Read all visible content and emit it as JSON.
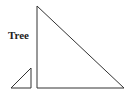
{
  "diagram": {
    "label": "Tree",
    "stroke_color": "#333333",
    "big_triangle": {
      "points": "37,6 37,88 124,88"
    },
    "small_triangle": {
      "points": "11,88 31,68 31,88"
    }
  }
}
